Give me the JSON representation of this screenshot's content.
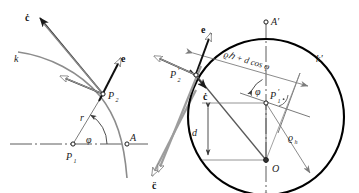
{
  "figure": {
    "width": 359,
    "height": 193,
    "background": "#ffffff",
    "colors": {
      "ink_dark": "#1a1a1a",
      "ink_mid": "#555555",
      "ink_light": "#8a8a8a",
      "circle_stroke": "#000000",
      "label": "#1a1a1a"
    }
  },
  "left_panel": {
    "name": "left-figure",
    "labels": {
      "c_dot": "ċ",
      "curve_k": "k",
      "e_vector": "e",
      "point_p2": "P",
      "point_p2_sub": "2",
      "radius_r": "r",
      "angle_phi": "φ",
      "point_p1": "P",
      "point_p1_sub": "1",
      "point_a": "A",
      "c_ddot": "c̈"
    }
  },
  "right_panel": {
    "name": "right-figure",
    "labels": {
      "e_vector": "e",
      "point_p2prime": "P",
      "point_p2prime_sub": "2",
      "point_p2prime_prime": "′",
      "c_dot": "ċ",
      "chord_expression": "ϱℎ + d cos φ",
      "chord_rho_h": "ϱ",
      "chord_rho_sub": "h",
      "chord_rest": " + d cos φ",
      "point_a_prime": "A′",
      "circle_k_prime": "k′",
      "angle_phi": "φ",
      "point_p1prime": "P",
      "point_p1prime_sub": "1",
      "point_p1prime_prime": "′",
      "distance_d": "d",
      "radius_rho_h": "ϱ",
      "radius_rho_h_sub": "h",
      "center_o": "O"
    }
  }
}
